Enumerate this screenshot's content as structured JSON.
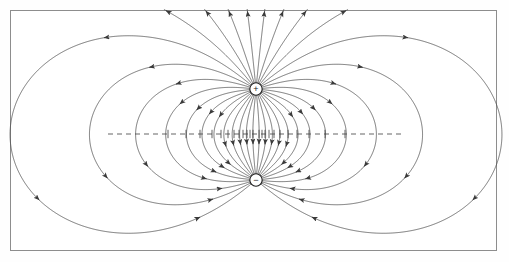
{
  "figure": {
    "type": "vector-field-diagram",
    "background_color": "#ffffff",
    "frame": {
      "color": "#8d8d8d",
      "x": 10,
      "y": 10,
      "width": 487,
      "height": 241,
      "line_width": 1.4
    }
  },
  "charges": [
    {
      "id": "positive-charge",
      "label": "+",
      "sign": 1,
      "cx": 256,
      "cy": 89,
      "radius": 6.2,
      "stroke": "#1a1a1a",
      "fill": "#ffffff"
    },
    {
      "id": "negative-charge",
      "label": "−",
      "sign": -1,
      "cx": 256,
      "cy": 180,
      "radius": 6.2,
      "stroke": "#1a1a1a",
      "fill": "#ffffff"
    }
  ],
  "field_lines": {
    "name": "electric-field-lines",
    "style": "solid",
    "stroke": "#4a4a4a",
    "stroke_width": 0.75,
    "arrow_color": "#3a3a3a",
    "count": 32,
    "start_angles_deg": [
      5.6,
      16.9,
      28.1,
      39.4,
      50.6,
      61.9,
      73.1,
      84.4,
      95.6,
      106.9,
      118.1,
      129.4,
      140.6,
      151.9,
      163.1,
      174.4,
      185.6,
      196.9,
      208.1,
      219.4,
      230.6,
      241.9,
      253.1,
      264.4,
      275.6,
      286.9,
      298.1,
      309.4,
      320.6,
      331.9,
      343.1,
      354.4
    ],
    "description": "Solid curves leaving the positive charge and entering the negative charge."
  },
  "equipotentials": {
    "name": "equipotential-lines",
    "style": "dashed",
    "stroke": "#545454",
    "stroke_width": 0.75,
    "dash_pattern": "3.2 2.6",
    "levels": [
      0.42,
      0.55,
      0.72,
      0.95,
      1.3,
      1.85,
      2.8,
      4.6,
      9.0
    ],
    "description": "Dashed closed curves surrounding each charge, orthogonal to the field lines."
  },
  "midplane": {
    "name": "zero-potential-plane",
    "style": "dashed",
    "stroke": "#4a4a4a",
    "y": 134,
    "x_start": 108,
    "x_end": 402,
    "dash_pattern": "5 4"
  },
  "geometry": {
    "center_x": 256,
    "center_y": 134.5,
    "half_separation": 45.5,
    "view_left": 12,
    "view_right": 500,
    "view_top": 12,
    "view_bottom": 250
  }
}
